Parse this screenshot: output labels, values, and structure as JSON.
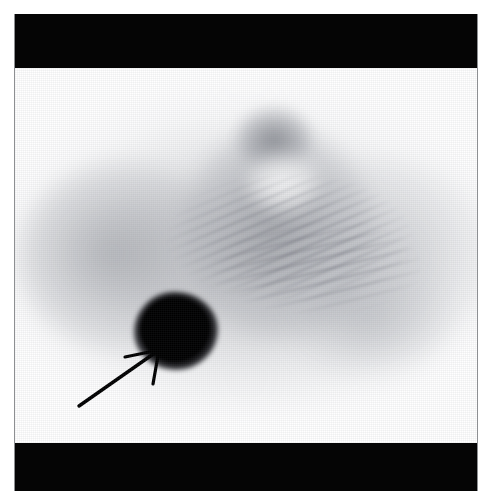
{
  "figure": {
    "modality": "nuclear-medicine-tomographic-scan",
    "view": "axial-transverse-slice",
    "width_px": 504,
    "height_px": 491,
    "background_color": "#ffffff",
    "letterbox_color": "#050505",
    "frame_border_color": "#8d8f92",
    "colormap": "inverse-grayscale"
  },
  "bands": {
    "top_band_name": "top-letterbox-band",
    "bottom_band_name": "bottom-letterbox-band"
  },
  "scan": {
    "canvas_name": "tomographic-slice-canvas",
    "body_outline_name": "body-soft-tissue-silhouette",
    "regions": [
      {
        "id": "tissue-left",
        "label": "left-soft-tissue-region"
      },
      {
        "id": "tissue-right",
        "label": "right-soft-tissue-region"
      },
      {
        "id": "mediastinum",
        "label": "central-mediastinal-blush"
      },
      {
        "id": "spine-focus",
        "label": "vertebral-midline-focus"
      },
      {
        "id": "photopenic",
        "label": "photopenic-central-area"
      },
      {
        "id": "tissue-lower-right",
        "label": "inferior-right-soft-tissue"
      }
    ],
    "artifacts": {
      "streak_label": "diagonal-reconstruction-streak-artifact",
      "grain_label": "acquisition-noise-grain"
    }
  },
  "lesion": {
    "name": "focal-hyperintense-lesion",
    "description": "intense-focal-radiotracer-uptake",
    "center_x": 161,
    "center_y": 317,
    "intensity": "maximal",
    "fill_color": "#000000"
  },
  "annotation": {
    "arrow_name": "lesion-pointer-arrow",
    "color": "#000000",
    "tail_x": 62,
    "tail_y": 340,
    "tip_x": 147,
    "tip_y": 272,
    "points_at": "focal-hyperintense-lesion"
  }
}
